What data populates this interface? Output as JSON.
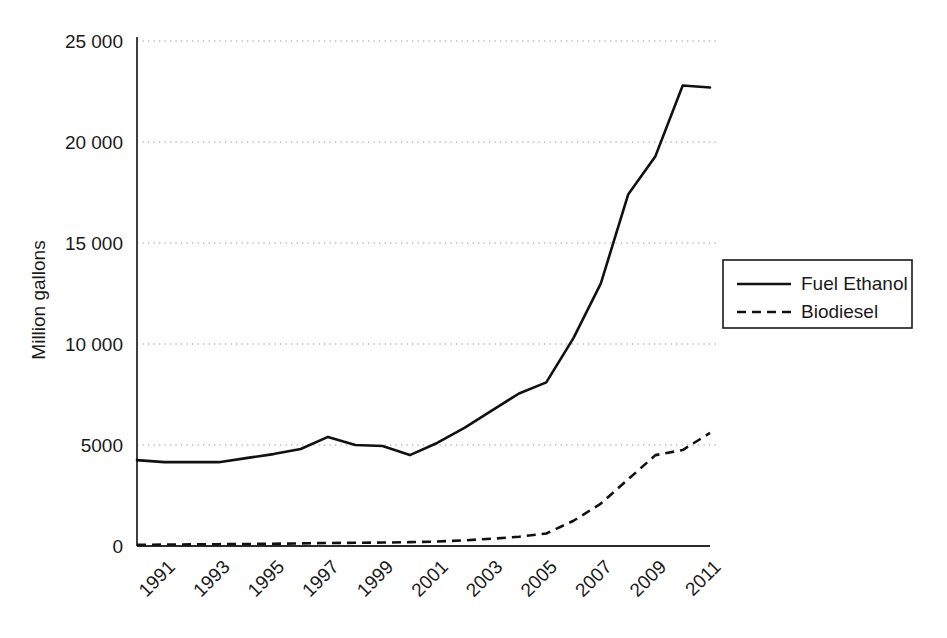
{
  "chart_data": {
    "type": "line",
    "title": "",
    "xlabel": "",
    "ylabel": "Million gallons",
    "x": [
      1990,
      1991,
      1992,
      1993,
      1994,
      1995,
      1996,
      1997,
      1998,
      1999,
      2000,
      2001,
      2002,
      2003,
      2004,
      2005,
      2006,
      2007,
      2008,
      2009,
      2010,
      2011
    ],
    "xlim": [
      1990,
      2011
    ],
    "ylim": [
      0,
      25000
    ],
    "yticks": [
      0,
      5000,
      10000,
      15000,
      20000,
      25000
    ],
    "ytick_labels": [
      "0",
      "5000",
      "10 000",
      "15 000",
      "20 000",
      "25 000"
    ],
    "xticks": [
      1991,
      1993,
      1995,
      1997,
      1999,
      2001,
      2003,
      2005,
      2007,
      2009,
      2011
    ],
    "xtick_labels": [
      "1991",
      "1993",
      "1995",
      "1997",
      "1999",
      "2001",
      "2003",
      "2005",
      "2007",
      "2009",
      "2011"
    ],
    "xtick_rotation_deg": 45,
    "grid": "horizontal-dotted",
    "legend_position": "right-middle",
    "series": [
      {
        "name": "Fuel Ethanol",
        "style": "solid",
        "color": "#111111",
        "values": [
          4250,
          4150,
          4150,
          4150,
          4350,
          4550,
          4800,
          5400,
          5000,
          4950,
          4500,
          5100,
          5850,
          6700,
          7550,
          8100,
          10300,
          13000,
          17400,
          19300,
          22800,
          22700
        ]
      },
      {
        "name": "Biodiesel",
        "style": "dashed",
        "color": "#111111",
        "values": [
          60,
          70,
          80,
          90,
          100,
          110,
          130,
          150,
          160,
          170,
          190,
          220,
          280,
          360,
          460,
          620,
          1250,
          2100,
          3300,
          4500,
          4750,
          5600
        ]
      }
    ]
  },
  "legend": {
    "entries": [
      {
        "label": "Fuel Ethanol",
        "style": "solid"
      },
      {
        "label": "Biodiesel",
        "style": "dashed"
      }
    ]
  },
  "axis": {
    "y_title": "Million gallons"
  }
}
